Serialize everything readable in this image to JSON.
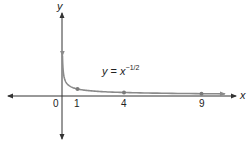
{
  "chart_data": {
    "type": "line",
    "title": "",
    "xlabel": "x",
    "ylabel": "y",
    "annotation": {
      "var": "y",
      "eq": "=",
      "base": "x",
      "exponent": "−1/2"
    },
    "x_ticks": [
      "0",
      "1",
      "4",
      "9"
    ],
    "highlighted_points": [
      {
        "x": 1,
        "y": 1
      },
      {
        "x": 4,
        "y": 0.5
      },
      {
        "x": 9,
        "y": 0.3333
      }
    ],
    "series": [
      {
        "name": "y = x^(-1/2)",
        "function": "x^(-1/2)",
        "domain": [
          0.03,
          10.5
        ]
      }
    ],
    "grid": false,
    "legend": null,
    "colors": {
      "axis": "#333333",
      "curve": "#8a8a8a",
      "points": "#7a7a7a"
    }
  }
}
